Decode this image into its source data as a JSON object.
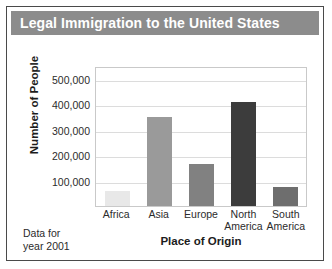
{
  "card": {
    "title": "Legal Immigration to the United States",
    "note_line1": "Data for",
    "note_line2": "year 2001"
  },
  "chart_data": {
    "type": "bar",
    "title": "Legal Immigration to the United States",
    "xlabel": "Place of Origin",
    "ylabel": "Number of People",
    "categories": [
      "Africa",
      "Asia",
      "Europe",
      "North America",
      "South America"
    ],
    "category_lines": [
      [
        "Africa"
      ],
      [
        "Asia"
      ],
      [
        "Europe"
      ],
      [
        "North",
        "America"
      ],
      [
        "South",
        "America"
      ]
    ],
    "values": [
      60000,
      350000,
      165000,
      410000,
      75000
    ],
    "bar_colors": [
      "#e8e8e8",
      "#9a9a9a",
      "#818181",
      "#3c3c3c",
      "#6e6e6e"
    ],
    "ylim": [
      0,
      550000
    ],
    "yticks": [
      100000,
      200000,
      300000,
      400000,
      500000
    ],
    "ytick_labels": [
      "100,000",
      "200,000",
      "300,000",
      "400,000",
      "500,000"
    ],
    "grid": true,
    "legend": "none",
    "annotation": "Data for year 2001"
  },
  "colors": {
    "title_bar": "#8c8c8c",
    "title_text": "#ffffff",
    "card_border": "#4a4a4a",
    "plot_border": "#c9c9c9",
    "gridline": "#dcdcdc"
  }
}
